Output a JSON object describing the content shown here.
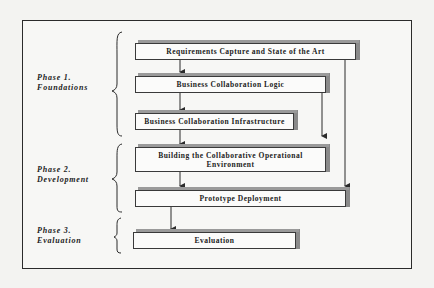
{
  "diagram": {
    "phases": [
      {
        "id": "phase1",
        "line1": "Phase 1.",
        "line2": "Foundations"
      },
      {
        "id": "phase2",
        "line1": "Phase 2.",
        "line2": "Development"
      },
      {
        "id": "phase3",
        "line1": "Phase 3.",
        "line2": "Evaluation"
      }
    ],
    "boxes": [
      {
        "id": "requirements",
        "label": "Requirements Capture and State of the Art"
      },
      {
        "id": "logic",
        "label": "Business Collaboration Logic"
      },
      {
        "id": "infrastructure",
        "label": "Business Collaboration Infrastructure"
      },
      {
        "id": "building",
        "line1": "Building the Collaborative Operational",
        "line2": "Environment"
      },
      {
        "id": "prototype",
        "label": "Prototype Deployment"
      },
      {
        "id": "evaluation",
        "label": "Evaluation"
      }
    ],
    "connections": [
      {
        "from": "requirements",
        "to": "logic"
      },
      {
        "from": "logic",
        "to": "infrastructure"
      },
      {
        "from": "infrastructure",
        "to": "building"
      },
      {
        "from": "logic",
        "to": "building",
        "route": "right-side"
      },
      {
        "from": "building",
        "to": "prototype"
      },
      {
        "from": "requirements",
        "to": "prototype",
        "route": "right-side"
      },
      {
        "from": "prototype",
        "to": "evaluation"
      }
    ],
    "colors": {
      "box_fill": "#fbfbfa",
      "box_shadow": "#8a8a8a",
      "line": "#2b2b2b",
      "page": "#f3f3f1"
    }
  }
}
